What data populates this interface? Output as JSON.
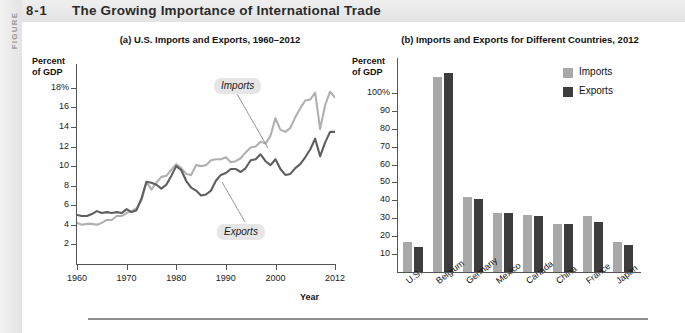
{
  "figure": {
    "rail_word": "FIGURE",
    "number": "8-1",
    "title": "The Growing Importance of International Trade"
  },
  "chart_data": [
    {
      "type": "line",
      "panel": "a",
      "title": "(a) U.S. Imports and Exports, 1960–2012",
      "ylabel": "Percent of GDP",
      "ylabel_line1": "Percent",
      "ylabel_line2": "of GDP",
      "xlabel": "Year",
      "ylim": [
        0,
        19
      ],
      "xlim": [
        1960,
        2012
      ],
      "ytick_labels": [
        "18%",
        "16",
        "14",
        "12",
        "10",
        "8",
        "6",
        "4",
        "2"
      ],
      "ytick_values": [
        18,
        16,
        14,
        12,
        10,
        8,
        6,
        4,
        2
      ],
      "xtick_labels": [
        "1960",
        "1970",
        "1980",
        "1990",
        "2000",
        "2012"
      ],
      "xtick_values": [
        1960,
        1970,
        1980,
        1990,
        2000,
        2012
      ],
      "grid": false,
      "annotations": [
        {
          "text": "Imports",
          "series": "Imports"
        },
        {
          "text": "Exports",
          "series": "Exports"
        }
      ],
      "series": [
        {
          "name": "Imports",
          "color": "#b0b0b0",
          "x": [
            1960,
            1961,
            1962,
            1963,
            1964,
            1965,
            1966,
            1967,
            1968,
            1969,
            1970,
            1971,
            1972,
            1973,
            1974,
            1975,
            1976,
            1977,
            1978,
            1979,
            1980,
            1981,
            1982,
            1983,
            1984,
            1985,
            1986,
            1987,
            1988,
            1989,
            1990,
            1991,
            1992,
            1993,
            1994,
            1995,
            1996,
            1997,
            1998,
            1999,
            2000,
            2001,
            2002,
            2003,
            2004,
            2005,
            2006,
            2007,
            2008,
            2009,
            2010,
            2011,
            2012
          ],
          "values": [
            4.2,
            4.0,
            4.1,
            4.1,
            4.0,
            4.2,
            4.5,
            4.5,
            4.9,
            4.9,
            5.2,
            5.4,
            5.7,
            6.5,
            8.4,
            7.6,
            8.3,
            8.9,
            9.0,
            9.6,
            10.2,
            9.8,
            9.2,
            9.1,
            10.1,
            10.0,
            10.1,
            10.6,
            10.7,
            10.7,
            10.9,
            10.4,
            10.5,
            10.8,
            11.4,
            11.9,
            12.0,
            12.5,
            12.3,
            13.1,
            14.9,
            13.7,
            13.5,
            13.9,
            15.0,
            15.9,
            16.7,
            16.8,
            17.5,
            13.8,
            16.2,
            17.6,
            17.0
          ]
        },
        {
          "name": "Exports",
          "color": "#5e5e5e",
          "x": [
            1960,
            1961,
            1962,
            1963,
            1964,
            1965,
            1966,
            1967,
            1968,
            1969,
            1970,
            1971,
            1972,
            1973,
            1974,
            1975,
            1976,
            1977,
            1978,
            1979,
            1980,
            1981,
            1982,
            1983,
            1984,
            1985,
            1986,
            1987,
            1988,
            1989,
            1990,
            1991,
            1992,
            1993,
            1994,
            1995,
            1996,
            1997,
            1998,
            1999,
            2000,
            2001,
            2002,
            2003,
            2004,
            2005,
            2006,
            2007,
            2008,
            2009,
            2010,
            2011,
            2012
          ],
          "values": [
            5.0,
            4.9,
            4.9,
            5.1,
            5.4,
            5.2,
            5.3,
            5.2,
            5.3,
            5.2,
            5.6,
            5.3,
            5.5,
            6.7,
            8.4,
            8.3,
            8.1,
            7.7,
            8.1,
            9.0,
            10.0,
            9.6,
            8.5,
            7.8,
            7.5,
            7.0,
            7.1,
            7.5,
            8.5,
            9.1,
            9.3,
            9.7,
            9.7,
            9.4,
            9.8,
            10.6,
            10.7,
            11.2,
            10.5,
            10.1,
            10.7,
            9.7,
            9.1,
            9.2,
            9.8,
            10.2,
            10.9,
            11.7,
            12.8,
            11.0,
            12.4,
            13.5,
            13.5
          ]
        }
      ]
    },
    {
      "type": "bar",
      "panel": "b",
      "title": "(b) Imports and Exports for Different Countries, 2012",
      "ylabel": "Percent of GDP",
      "ylabel_line1": "Percent",
      "ylabel_line2": "of GDP",
      "xlabel": "",
      "ylim": [
        0,
        115
      ],
      "ytick_labels": [
        "100%",
        "90",
        "80",
        "70",
        "60",
        "50",
        "40",
        "30",
        "20",
        "10"
      ],
      "ytick_values": [
        100,
        90,
        80,
        70,
        60,
        50,
        40,
        30,
        20,
        10
      ],
      "grid": false,
      "legend_position": "top-right",
      "categories": [
        "U.S.",
        "Belgium",
        "Germany",
        "Mexico",
        "Canada",
        "China",
        "France",
        "Japan"
      ],
      "series": [
        {
          "name": "Imports",
          "color": "#a8a8a8",
          "values": [
            17,
            109,
            42,
            33,
            32,
            27,
            31,
            17
          ]
        },
        {
          "name": "Exports",
          "color": "#3d3d3d",
          "values": [
            14,
            111,
            41,
            33,
            31,
            27,
            28,
            15
          ]
        }
      ]
    }
  ]
}
